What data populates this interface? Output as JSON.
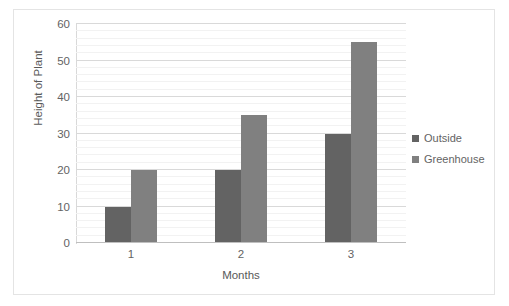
{
  "chart_data": {
    "type": "bar",
    "title": "",
    "subtitle": "",
    "xlabel": "Months",
    "ylabel": "Height of Plant",
    "categories": [
      "1",
      "2",
      "3"
    ],
    "series": [
      {
        "name": "Outside",
        "values": [
          10,
          20,
          30
        ],
        "color": "#636363"
      },
      {
        "name": "Greenhouse",
        "values": [
          20,
          35,
          55
        ],
        "color": "#808080"
      }
    ],
    "ylim": [
      0,
      60
    ],
    "ytick_values": [
      0,
      10,
      20,
      30,
      40,
      50,
      60
    ],
    "ytick_labels": [
      "0",
      "10",
      "20",
      "30",
      "40",
      "50",
      "60"
    ],
    "y_major_step": 10,
    "y_minor_step": 2,
    "grid": {
      "horizontal_major": true,
      "horizontal_minor": true,
      "vertical": false
    },
    "legend": {
      "position": "right",
      "entries": [
        "Outside",
        "Greenhouse"
      ]
    },
    "colors": {
      "outside": "#636363",
      "greenhouse": "#808080",
      "gridline_major": "#d9d9d9",
      "gridline_minor": "#f2f2f2",
      "axis": "#bfbfbf",
      "text": "#595959",
      "border": "#e4e4e4",
      "background": "#ffffff"
    }
  },
  "axes": {
    "y_title": "Height of Plant",
    "x_title": "Months"
  },
  "legend": {
    "items": [
      {
        "label": "Outside"
      },
      {
        "label": "Greenhouse"
      }
    ]
  }
}
